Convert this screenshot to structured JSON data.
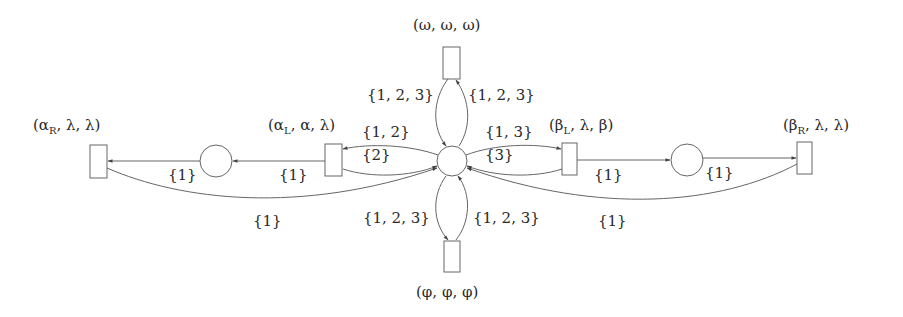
{
  "diagram": {
    "type": "petri-net",
    "colors": {
      "stroke": "#555555",
      "text": "#2a2a2a",
      "background": "#ffffff"
    },
    "transitions": [
      {
        "id": "alpha_R",
        "label": "(αR, λ, λ)",
        "label_html": "(α<sub>R</sub>, λ, λ)",
        "x": 90,
        "y": 145,
        "w": 17,
        "h": 33
      },
      {
        "id": "alpha_L",
        "label": "(αL, α, λ)",
        "label_html": "(α<sub>L</sub>, α, λ)",
        "x": 325,
        "y": 144,
        "w": 17,
        "h": 32
      },
      {
        "id": "omega",
        "label": "(ω, ω, ω)",
        "label_html": "(ω, ω, ω)",
        "x": 443,
        "y": 47,
        "w": 17,
        "h": 32
      },
      {
        "id": "phi",
        "label": "(φ, φ, φ)",
        "label_html": "(φ, φ, φ)",
        "x": 444,
        "y": 241,
        "w": 16,
        "h": 31
      },
      {
        "id": "beta_L",
        "label": "(βL, λ, β)",
        "label_html": "(β<sub>L</sub>, λ, β)",
        "x": 562,
        "y": 143,
        "w": 15,
        "h": 32
      },
      {
        "id": "beta_R",
        "label": "(βR, λ, λ)",
        "label_html": "(β<sub>R</sub>, λ, λ)",
        "x": 797,
        "y": 142,
        "w": 15,
        "h": 32
      }
    ],
    "places": [
      {
        "id": "left_place",
        "cx": 216,
        "cy": 161,
        "r": 16
      },
      {
        "id": "center_place",
        "cx": 452,
        "cy": 161,
        "r": 15
      },
      {
        "id": "right_place",
        "cx": 687,
        "cy": 160,
        "r": 16
      }
    ],
    "arc_labels": {
      "left_place_to_alpha_R": "{1}",
      "alpha_L_to_left_place": "{1}",
      "alpha_R_to_center": "{1}",
      "center_to_alpha_L": "{1, 2}",
      "alpha_L_to_center": "{2}",
      "center_to_omega": "{1, 2, 3}",
      "omega_to_center": "{1, 2, 3}",
      "center_to_beta_L": "{1, 3}",
      "beta_L_to_center": "{3}",
      "beta_L_to_right_place": "{1}",
      "right_place_to_beta_R": "{1}",
      "beta_R_to_center": "{1}",
      "center_to_phi": "{1, 2, 3}",
      "phi_to_center": "{1, 2, 3}"
    }
  }
}
